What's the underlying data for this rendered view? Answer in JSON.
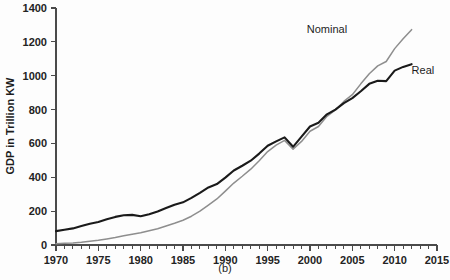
{
  "chart_data": {
    "type": "line",
    "title": "",
    "caption": "(b)",
    "xlabel": "",
    "ylabel": "GDP in Trillion KW",
    "xlim": [
      1970,
      2015
    ],
    "ylim": [
      0,
      1400
    ],
    "grid": false,
    "legend_position": "inline-annotation",
    "x_ticks": [
      1970,
      1975,
      1980,
      1985,
      1990,
      1995,
      2000,
      2005,
      2010,
      2015
    ],
    "x_minor_tick_step": 1,
    "y_ticks": [
      0,
      200,
      400,
      600,
      800,
      1000,
      1200,
      1400
    ],
    "x": [
      1970,
      1971,
      1972,
      1973,
      1974,
      1975,
      1976,
      1977,
      1978,
      1979,
      1980,
      1981,
      1982,
      1983,
      1984,
      1985,
      1986,
      1987,
      1988,
      1989,
      1990,
      1991,
      1992,
      1993,
      1994,
      1995,
      1996,
      1997,
      1998,
      1999,
      2000,
      2001,
      2002,
      2003,
      2004,
      2005,
      2006,
      2007,
      2008,
      2009,
      2010,
      2011,
      2012
    ],
    "series": [
      {
        "name": "Real",
        "color": "#1a1a1a",
        "width": 2.1,
        "label_x": 2012,
        "label_y": 1020,
        "values": [
          82,
          90,
          98,
          112,
          126,
          136,
          152,
          166,
          176,
          178,
          170,
          182,
          198,
          218,
          238,
          252,
          278,
          308,
          340,
          360,
          398,
          440,
          468,
          498,
          540,
          586,
          612,
          636,
          580,
          640,
          700,
          722,
          772,
          800,
          838,
          868,
          908,
          952,
          970,
          968,
          1030,
          1052,
          1068
        ],
        "units": "Trillion KW"
      },
      {
        "name": "Nominal",
        "color": "#8e8e8e",
        "width": 1.5,
        "label_x": 2002,
        "label_y": 1250,
        "values": [
          8,
          10,
          12,
          16,
          22,
          28,
          36,
          44,
          54,
          64,
          72,
          84,
          96,
          112,
          128,
          146,
          170,
          200,
          236,
          272,
          318,
          366,
          406,
          448,
          498,
          552,
          590,
          618,
          566,
          612,
          672,
          700,
          760,
          798,
          848,
          888,
          952,
          1012,
          1058,
          1084,
          1160,
          1218,
          1272
        ],
        "units": "Trillion KW"
      }
    ],
    "annotations": [
      {
        "text": "Nominal",
        "x": 2002,
        "y": 1250
      },
      {
        "text": "Real",
        "x": 2012,
        "y": 1010
      }
    ]
  },
  "figure": {
    "caption": "(b)",
    "ylabel": "GDP in Trillion KW"
  }
}
